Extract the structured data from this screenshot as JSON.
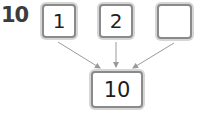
{
  "problem": {
    "number": "10",
    "parts": [
      {
        "value": "1"
      },
      {
        "value": "2"
      },
      {
        "value": ""
      }
    ],
    "whole": {
      "value": "10"
    }
  },
  "colors": {
    "border": "#8a8a8a",
    "arrow": "#9a9a9a",
    "text": "#1e1e1e"
  }
}
